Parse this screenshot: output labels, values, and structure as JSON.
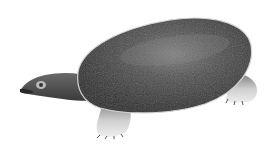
{
  "image": {
    "subject": "softshell turtle illustration",
    "description": "Grayscale drawing of a softshell turtle in side view, facing left, with a large dark oval carapace, extended neck and head, and pale clawed feet",
    "background_color": "#ffffff",
    "colors": {
      "shell_dark": "#2e2e2e",
      "shell_mid": "#4a4a4a",
      "shell_highlight": "#7a7a7a",
      "shell_rim": "#d8d8d8",
      "skin": "#555555",
      "feet_light": "#d9d9d9"
    }
  }
}
